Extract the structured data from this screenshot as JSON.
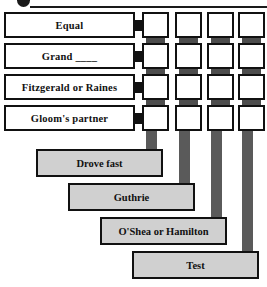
{
  "puzzle": {
    "top_bullet_icon": "bullet-dot-icon",
    "clues": [
      {
        "id": "clue-1",
        "label": "Equal"
      },
      {
        "id": "clue-2",
        "label": "Grand ____"
      },
      {
        "id": "clue-3",
        "label": "Fitzgerald or Raines"
      },
      {
        "id": "clue-4",
        "label": "Gloom's partner"
      }
    ],
    "grid": {
      "rows": 4,
      "columns": 4,
      "cells": [
        [
          "",
          "",
          "",
          ""
        ],
        [
          "",
          "",
          "",
          ""
        ],
        [
          "",
          "",
          "",
          ""
        ],
        [
          "",
          "",
          "",
          ""
        ]
      ]
    },
    "answers": [
      {
        "id": "answer-1",
        "label": "Drove fast"
      },
      {
        "id": "answer-2",
        "label": "Guthrie"
      },
      {
        "id": "answer-3",
        "label": "O'Shea or Hamilton"
      },
      {
        "id": "answer-4",
        "label": "Test"
      }
    ],
    "colors": {
      "outline": "#111111",
      "clue_fill": "#ffffff",
      "answer_fill": "#d0d0d0",
      "connector": "#5a5a5a",
      "joint": "#4d4d4d"
    }
  }
}
